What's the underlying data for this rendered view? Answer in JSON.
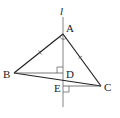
{
  "diagram": {
    "type": "geometry",
    "line_label": "l",
    "points": {
      "A": {
        "label": "A",
        "x": 63,
        "y": 34
      },
      "B": {
        "label": "B",
        "x": 14,
        "y": 73
      },
      "C": {
        "label": "C",
        "x": 101,
        "y": 86
      },
      "D": {
        "label": "D",
        "x": 63,
        "y": 73
      },
      "E": {
        "label": "E",
        "x": 63,
        "y": 86
      }
    },
    "segments": [
      "AB",
      "AC",
      "BC",
      "BD",
      "CE"
    ],
    "equal_marks": [
      "AB",
      "AC"
    ],
    "right_angles": [
      "BDA",
      "CEA"
    ],
    "colors": {
      "stroke": "#222222",
      "line_l": "#777777",
      "thin": "#555555"
    }
  }
}
